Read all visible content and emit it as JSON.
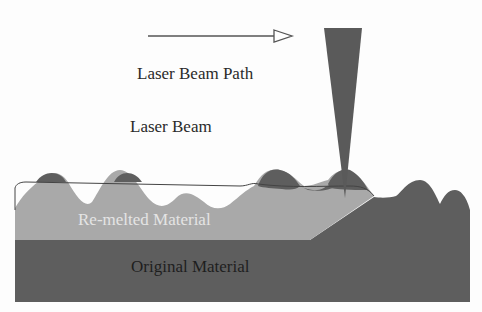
{
  "diagram": {
    "labels": {
      "path": "Laser Beam Path",
      "beam": "Laser Beam",
      "remelted": "Re-melted Material",
      "original": "Original Material"
    },
    "colors": {
      "background": "#fdfdfd",
      "original_material": "#5e5e5e",
      "remelted_material": "#a9a9a9",
      "laser_beam": "#5a5a5a",
      "outline": "#444444",
      "text": "#2a2a2a",
      "remelted_text": "#e4e4e4"
    }
  }
}
